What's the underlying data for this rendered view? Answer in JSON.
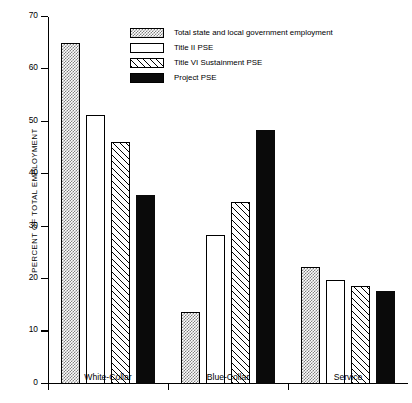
{
  "chart_data": {
    "type": "bar",
    "title": "",
    "subtitle": "",
    "xlabel": "",
    "ylabel": "PERCENT OF TOTAL EMPLOYMENT",
    "ylim": [
      0,
      70
    ],
    "yticks": [
      0,
      10,
      20,
      30,
      40,
      50,
      60,
      70
    ],
    "ytick_labels": [
      "0",
      "10",
      "20",
      "30",
      "40",
      "50",
      "60",
      "70"
    ],
    "grid": false,
    "legend_position": "top-center",
    "categories": [
      "White-Collar",
      "Blue-Collar",
      "Service"
    ],
    "series": [
      {
        "name": "Total state and local government employment",
        "pattern": "dotted-gray",
        "values": [
          65.0,
          13.8,
          22.3
        ]
      },
      {
        "name": "Title II PSE",
        "pattern": "white",
        "values": [
          51.3,
          28.5,
          19.9
        ]
      },
      {
        "name": "Title VI Sustainment PSE",
        "pattern": "diagonal-hatch",
        "values": [
          46.2,
          34.7,
          18.7
        ]
      },
      {
        "name": "Project PSE",
        "pattern": "solid-black",
        "values": [
          36.0,
          48.5,
          17.7
        ]
      }
    ]
  },
  "colors": {
    "axis": "#000000",
    "background": "#ffffff",
    "dotted_gray": "#808080",
    "solid_black": "#0a0a0a"
  }
}
